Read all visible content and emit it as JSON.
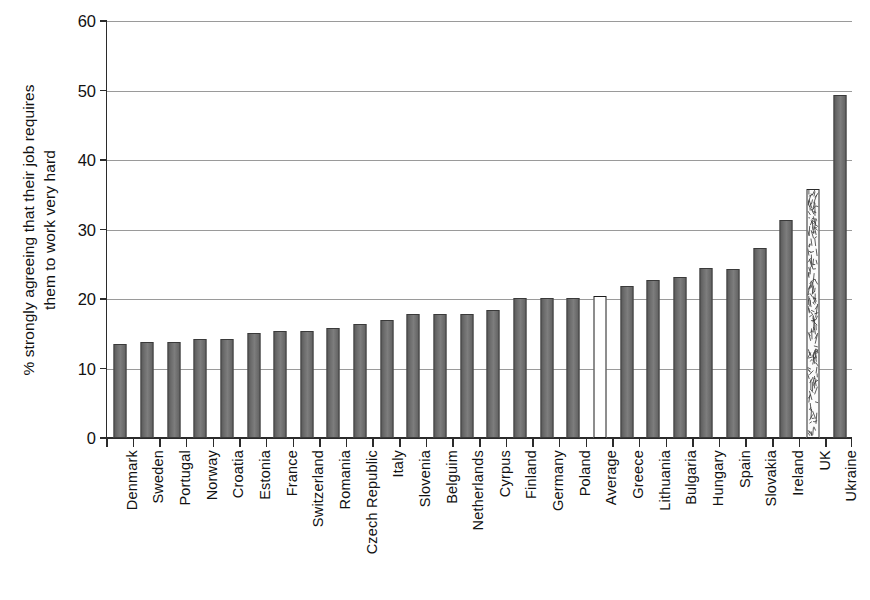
{
  "chart_data": {
    "type": "bar",
    "title": "",
    "subtitle": "",
    "xlabel": "",
    "ylabel": "% strongly agreeing that their job requires them to work very hard",
    "ylabel_lines": [
      "% strongly agreeing that their job requires",
      "them to work very hard"
    ],
    "ylim": [
      0,
      60
    ],
    "ytick_labels": [
      "0",
      "10",
      "20",
      "30",
      "40",
      "50",
      "60"
    ],
    "ytick_values": [
      0,
      10,
      20,
      30,
      40,
      50,
      60
    ],
    "grid": "horizontal",
    "legend": "none",
    "categories": [
      "Denmark",
      "Sweden",
      "Portugal",
      "Norway",
      "Croatia",
      "Estonia",
      "France",
      "Switzerland",
      "Romania",
      "Czech Republic",
      "Italy",
      "Slovenia",
      "Belguim",
      "Netherlands",
      "Cyrpus",
      "Finland",
      "Germany",
      "Poland",
      "Average",
      "Greece",
      "Lithuania",
      "Bulgaria",
      "Hungary",
      "Spain",
      "Slovakia",
      "Ireland",
      "UK",
      "Ukraine"
    ],
    "values": [
      13.5,
      13.8,
      13.8,
      14.2,
      14.2,
      15.1,
      15.4,
      15.4,
      15.9,
      16.4,
      17.0,
      17.9,
      17.9,
      17.9,
      18.4,
      20.2,
      20.2,
      20.2,
      20.5,
      21.9,
      22.7,
      23.2,
      24.4,
      24.3,
      27.4,
      31.3,
      35.8,
      49.4
    ],
    "bar_styles": [
      "filled",
      "filled",
      "filled",
      "filled",
      "filled",
      "filled",
      "filled",
      "filled",
      "filled",
      "filled",
      "filled",
      "filled",
      "filled",
      "filled",
      "filled",
      "filled",
      "filled",
      "filled",
      "hollow",
      "filled",
      "filled",
      "filled",
      "filled",
      "filled",
      "filled",
      "filled",
      "speckled",
      "filled"
    ],
    "colors": {
      "bar_fill": "#6e6e6e",
      "bar_edge": "#3a3a3a",
      "highlight_fill": "#ffffff",
      "highlight_edge": "#1c1c1c",
      "gridline": "#9a9a9a",
      "axis": "#2b2b2b",
      "background": "#ffffff",
      "text": "#111111"
    }
  }
}
